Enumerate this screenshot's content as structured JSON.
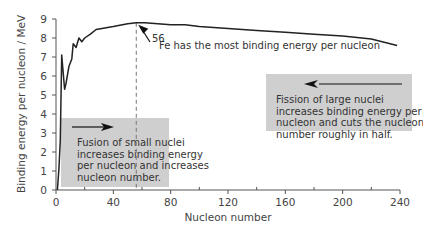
{
  "chart_data": {
    "type": "line",
    "title": "",
    "xlabel": "Nucleon number",
    "ylabel": "Binding energy per nucleon / MeV",
    "xlim": [
      0,
      240
    ],
    "ylim": [
      0,
      9
    ],
    "xticks": [
      0,
      40,
      80,
      120,
      160,
      200,
      240
    ],
    "yticks": [
      0,
      1,
      2,
      3,
      4,
      5,
      6,
      7,
      8,
      9
    ],
    "grid": false,
    "series": [
      {
        "name": "Binding energy per nucleon",
        "x": [
          1,
          2,
          3,
          4,
          6,
          7,
          9,
          11,
          12,
          14,
          16,
          18,
          20,
          24,
          28,
          32,
          40,
          50,
          56,
          62,
          80,
          90,
          100,
          120,
          140,
          160,
          180,
          200,
          220,
          238
        ],
        "y": [
          0,
          1.1,
          2.6,
          7.1,
          5.3,
          5.6,
          6.5,
          6.9,
          7.7,
          7.5,
          8.0,
          7.8,
          8.0,
          8.2,
          8.45,
          8.5,
          8.6,
          8.75,
          8.8,
          8.8,
          8.7,
          8.7,
          8.6,
          8.5,
          8.4,
          8.3,
          8.2,
          8.1,
          7.95,
          7.6
        ]
      }
    ],
    "annotations": [
      {
        "text": "Fe has the most binding energy per nucleon",
        "superscript": "56",
        "x": 56,
        "y": 8.8
      },
      {
        "text": "Fission of large nuclei increases binding energy per nucleon and cuts the nucleon number roughly in half.",
        "arrow": "left"
      },
      {
        "text": "Fusion of small nuclei increases binding energy per nucleon and increases nucleon number.",
        "arrow": "right"
      }
    ],
    "reference_line": {
      "x": 56,
      "style": "dashed"
    }
  },
  "labels": {
    "ylabel": "Binding energy per nucleon / MeV",
    "xlabel": "Nucleon number",
    "fe_sup": "56",
    "fe_text": "Fe has the most binding energy per nucleon",
    "fission_lines": [
      "Fission of large nuclei",
      "increases binding energy per",
      "nucleon and cuts the nucleon",
      "number roughly in half."
    ],
    "fusion_lines": [
      "Fusion of small nuclei",
      "increases binding energy",
      "per nucleon and increases",
      "nucleon number."
    ]
  },
  "colors": {
    "line": "#222222",
    "box": "#cfcfcf",
    "axis": "#555555",
    "dash": "#777777"
  }
}
